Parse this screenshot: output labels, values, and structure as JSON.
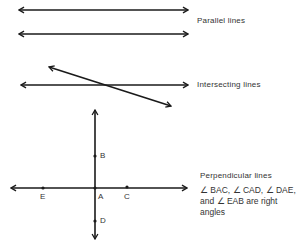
{
  "colors": {
    "line": "#1a1a1a",
    "text": "#333333",
    "background": "#ffffff"
  },
  "sections": {
    "parallel": {
      "label": "Parallel lines"
    },
    "intersecting": {
      "label": "Intersecting lines"
    },
    "perpendicular": {
      "label": "Perpendicular lines",
      "description_line1": "∠ BAC, ∠ CAD, ∠ DAE,",
      "description_line2": "and ∠ EAB are right",
      "description_line3": "angles",
      "points": {
        "A": "A",
        "B": "B",
        "C": "C",
        "D": "D",
        "E": "E"
      }
    }
  }
}
